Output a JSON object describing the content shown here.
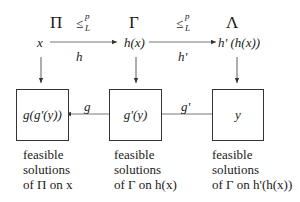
{
  "problems": {
    "first": "Π",
    "second": "Γ",
    "third": "Λ"
  },
  "reductions": {
    "first": {
      "rel": "≤",
      "sup": "p",
      "sub": "L"
    },
    "second": {
      "rel": "≤",
      "sup": "p",
      "sub": "L"
    }
  },
  "instances": {
    "first": "x",
    "second": "h(x)",
    "third": "h' (h(x))"
  },
  "maps": {
    "forward_first": "h",
    "forward_second": "h'",
    "backward_first": "g",
    "backward_second": "g'"
  },
  "boxes": {
    "first": "g(g'(y))",
    "second": "g'(y)",
    "third": "y"
  },
  "captions": {
    "first": {
      "line1": "feasible",
      "line2": "solutions",
      "line3": "of Π on x"
    },
    "second": {
      "line1": "feasible",
      "line2": "solutions",
      "line3": "of Γ on h(x)"
    },
    "third": {
      "line1": "feasible",
      "line2": "solutions",
      "line3": "of Γ on h'(h(x))"
    }
  }
}
